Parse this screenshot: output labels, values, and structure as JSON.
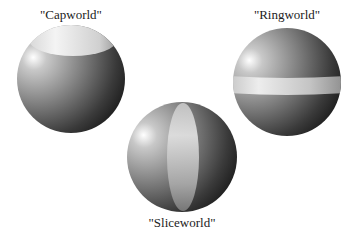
{
  "figure": {
    "worlds": [
      {
        "id": "capworld",
        "label": "\"Capworld\"",
        "feature": "cap"
      },
      {
        "id": "ringworld",
        "label": "\"Ringworld\"",
        "feature": "ring"
      },
      {
        "id": "sliceworld",
        "label": "\"Sliceworld\"",
        "feature": "slice"
      }
    ]
  },
  "colors": {
    "highlight": "#ffffff",
    "sphere_mid": "#8a8a8a",
    "sphere_dark": "#111111",
    "feature_light": "#e4e4e4",
    "feature_shade": "#9a9a9a"
  }
}
